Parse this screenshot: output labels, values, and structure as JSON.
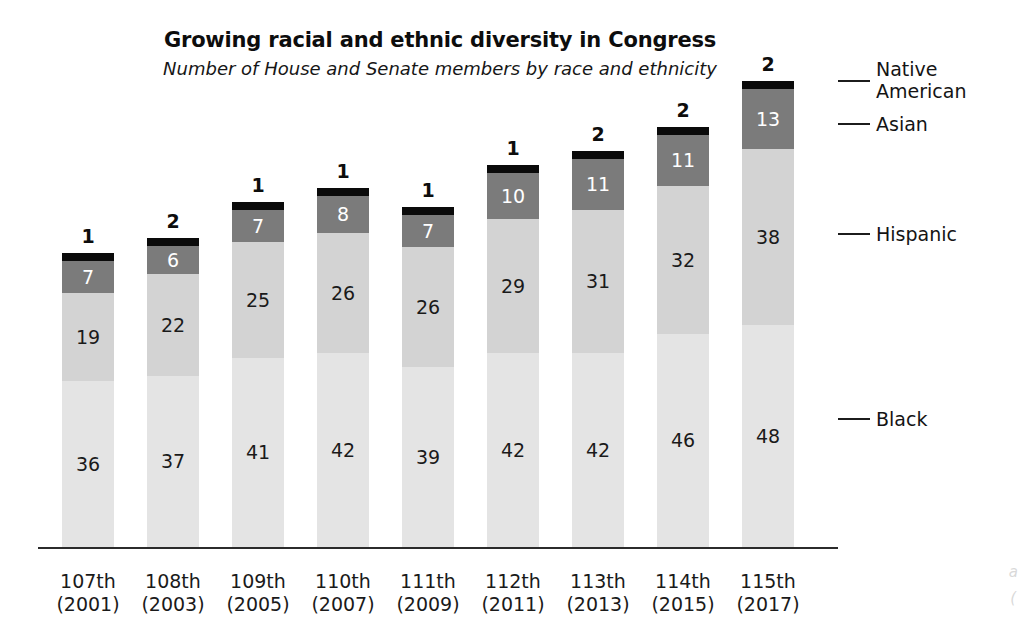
{
  "chart_data": {
    "type": "bar",
    "subtype": "stacked-vertical",
    "title": "Growing racial and ethnic diversity in Congress",
    "subtitle": "Number of House and Senate members by race and ethnicity",
    "xlabel": "",
    "ylabel": "",
    "grid": false,
    "legend_position": "right-inline-leader-lines",
    "categories": [
      "107th (2001)",
      "108th (2003)",
      "109th (2005)",
      "110th (2007)",
      "111th (2009)",
      "112th (2011)",
      "113th (2013)",
      "114th (2015)",
      "115th (2017)"
    ],
    "category_lines": [
      [
        "107th",
        "(2001)"
      ],
      [
        "108th",
        "(2003)"
      ],
      [
        "109th",
        "(2005)"
      ],
      [
        "110th",
        "(2007)"
      ],
      [
        "111th",
        "(2009)"
      ],
      [
        "112th",
        "(2011)"
      ],
      [
        "113th",
        "(2013)"
      ],
      [
        "114th",
        "(2015)"
      ],
      [
        "115th",
        "(2017)"
      ]
    ],
    "series": [
      {
        "name": "Black",
        "color": "#e4e4e4",
        "values": [
          36,
          37,
          41,
          42,
          39,
          42,
          42,
          46,
          48
        ]
      },
      {
        "name": "Hispanic",
        "color": "#d3d3d3",
        "values": [
          19,
          22,
          25,
          26,
          26,
          29,
          31,
          32,
          38
        ]
      },
      {
        "name": "Asian",
        "color": "#7b7b7b",
        "values": [
          7,
          6,
          7,
          8,
          7,
          10,
          11,
          11,
          13
        ]
      },
      {
        "name": "Native American",
        "color": "#0a0a0a",
        "values": [
          1,
          2,
          1,
          1,
          1,
          1,
          2,
          2,
          2
        ]
      }
    ],
    "totals": [
      63,
      67,
      74,
      77,
      73,
      82,
      86,
      91,
      101
    ],
    "ylim": [
      0,
      101
    ]
  },
  "legend": {
    "native_american": "Native\nAmerican",
    "asian": "Asian",
    "hispanic": "Hispanic",
    "black": "Black"
  },
  "artifact": {
    "line1": "a",
    "line2": "("
  }
}
